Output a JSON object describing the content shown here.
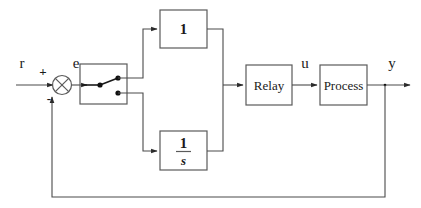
{
  "diagram": {
    "signals": {
      "reference": "r",
      "error": "e",
      "control": "u",
      "output": "y",
      "sum_plus": "+",
      "sum_minus": "-"
    },
    "blocks": [
      {
        "id": "proportional",
        "label": "1",
        "style": "bold-number"
      },
      {
        "id": "integrator",
        "numerator": "1",
        "denominator": "s",
        "style": "fraction"
      },
      {
        "id": "relay",
        "label": "Relay",
        "style": "text"
      },
      {
        "id": "process",
        "label": "Process",
        "style": "text"
      }
    ],
    "switch": {
      "id": "path-selector",
      "state": "upper",
      "contacts": [
        "upper",
        "lower"
      ]
    },
    "colors": {
      "background": "#ffffff",
      "wire": "#4a4a4a",
      "box": "#5a5a5a",
      "text": "#1a1a1a",
      "switch": "#111111"
    }
  }
}
